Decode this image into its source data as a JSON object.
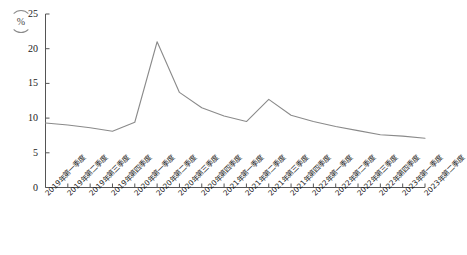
{
  "chart_data": {
    "type": "line",
    "title": "",
    "xlabel": "",
    "ylabel": "",
    "unit_label": "%",
    "ylim": [
      0,
      25
    ],
    "yticks": [
      0,
      5,
      10,
      15,
      20,
      25
    ],
    "grid": false,
    "legend": "none",
    "line_color": "#8a8a8a",
    "axis_color": "#555555",
    "categories": [
      "2019年第一季度",
      "2019年第二季度",
      "2019年第三季度",
      "2019年第四季度",
      "2020年第一季度",
      "2020年第二季度",
      "2020年第三季度",
      "2020年第四季度",
      "2021年第一季度",
      "2021年第二季度",
      "2021年第三季度",
      "2021年第四季度",
      "2022年第一季度",
      "2022年第二季度",
      "2022年第三季度",
      "2022年第四季度",
      "2023年第一季度",
      "2023年第二季度"
    ],
    "values": [
      9.3,
      9.0,
      8.6,
      8.1,
      9.4,
      21.0,
      13.7,
      11.5,
      10.3,
      9.5,
      12.7,
      10.4,
      9.5,
      8.8,
      8.2,
      7.6,
      7.4,
      7.1
    ]
  }
}
